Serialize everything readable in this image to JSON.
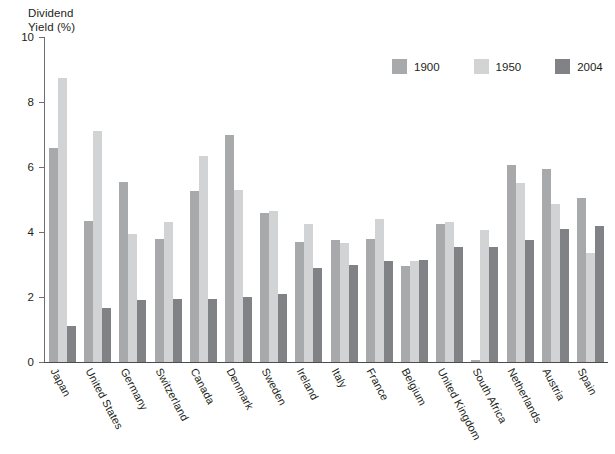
{
  "chart_data": {
    "type": "bar",
    "title": "",
    "xlabel": "",
    "ylabel": "Dividend\nYield (%)",
    "ylim": [
      0,
      10
    ],
    "yticks": [
      0,
      2,
      4,
      6,
      8,
      10
    ],
    "ytick_labels": [
      "0",
      "2",
      "4",
      "6",
      "8",
      "10"
    ],
    "grid": false,
    "legend_position": "top-right",
    "categories": [
      "Japan",
      "United States",
      "Germany",
      "Switzerland",
      "Canada",
      "Denmark",
      "Sweden",
      "Ireland",
      "Italy",
      "France",
      "Belgium",
      "United Kingdom",
      "South Africa",
      "Netherlands",
      "Austria",
      "Spain"
    ],
    "series": [
      {
        "name": "1900",
        "color": "#a7a9ab",
        "values": [
          6.6,
          4.35,
          5.55,
          3.8,
          5.25,
          7.0,
          4.6,
          3.7,
          3.75,
          3.8,
          2.95,
          4.25,
          0.05,
          6.05,
          5.95,
          5.05
        ]
      },
      {
        "name": "1950",
        "color": "#d2d3d4",
        "values": [
          8.75,
          7.1,
          3.95,
          4.3,
          6.35,
          5.3,
          4.65,
          4.25,
          3.65,
          4.4,
          3.1,
          4.3,
          4.05,
          5.5,
          4.85,
          3.35
        ]
      },
      {
        "name": "2004",
        "color": "#808285",
        "values": [
          1.1,
          1.65,
          1.9,
          1.95,
          1.95,
          2.0,
          2.1,
          2.9,
          3.0,
          3.1,
          3.15,
          3.55,
          3.55,
          3.75,
          4.1,
          4.2
        ]
      }
    ]
  },
  "legend": {
    "items": [
      {
        "label": "1900",
        "color": "#a7a9ab"
      },
      {
        "label": "1950",
        "color": "#d2d3d4"
      },
      {
        "label": "2004",
        "color": "#808285"
      }
    ]
  },
  "axis": {
    "y_title_line1": "Dividend",
    "y_title_line2": "Yield (%)"
  }
}
